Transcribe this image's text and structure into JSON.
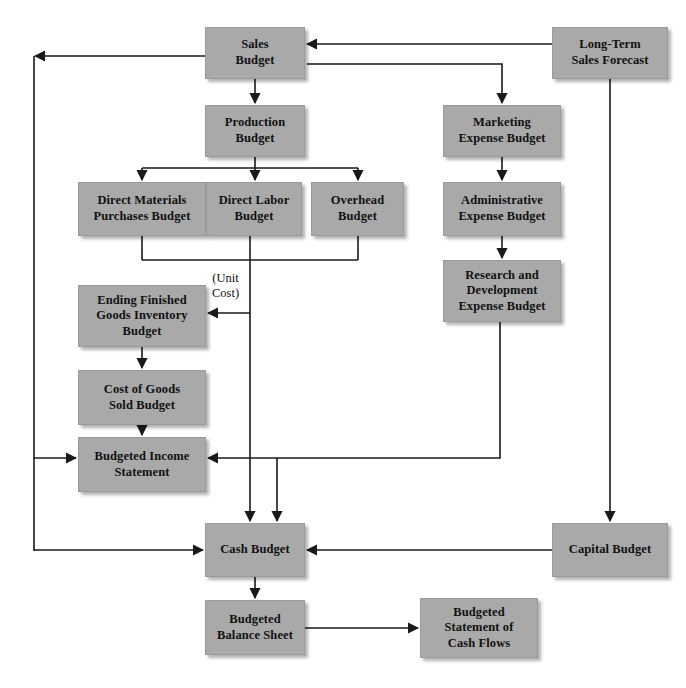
{
  "diagram": {
    "style": {
      "box_fill": "#a9a9a9",
      "box_border": "#9a9a9a",
      "line_color": "#1a1a1a",
      "text_color": "#111111",
      "background": "#ffffff"
    },
    "nodes": [
      {
        "id": "sales_budget",
        "label": "Sales\nBudget",
        "x": 205,
        "y": 27,
        "w": 100,
        "h": 52
      },
      {
        "id": "long_term_sales_forecast",
        "label": "Long-Term\nSales Forecast",
        "x": 552,
        "y": 27,
        "w": 116,
        "h": 52
      },
      {
        "id": "production_budget",
        "label": "Production\nBudget",
        "x": 205,
        "y": 105,
        "w": 100,
        "h": 52
      },
      {
        "id": "marketing_expense_budget",
        "label": "Marketing\nExpense Budget",
        "x": 443,
        "y": 105,
        "w": 118,
        "h": 52
      },
      {
        "id": "direct_materials_budget",
        "label": "Direct Materials\nPurchases Budget",
        "x": 78,
        "y": 182,
        "w": 128,
        "h": 54
      },
      {
        "id": "direct_labor_budget",
        "label": "Direct Labor\nBudget",
        "x": 206,
        "y": 182,
        "w": 96,
        "h": 54
      },
      {
        "id": "overhead_budget",
        "label": "Overhead\nBudget",
        "x": 311,
        "y": 182,
        "w": 93,
        "h": 54
      },
      {
        "id": "admin_expense_budget",
        "label": "Administrative\nExpense Budget",
        "x": 443,
        "y": 182,
        "w": 118,
        "h": 54
      },
      {
        "id": "ending_fg_inventory",
        "label": "Ending Finished\nGoods Inventory\nBudget",
        "x": 78,
        "y": 285,
        "w": 128,
        "h": 62
      },
      {
        "id": "rd_expense_budget",
        "label": "Research and\nDevelopment\nExpense Budget",
        "x": 443,
        "y": 260,
        "w": 118,
        "h": 62
      },
      {
        "id": "cogs_budget",
        "label": "Cost of Goods\nSold Budget",
        "x": 78,
        "y": 370,
        "w": 128,
        "h": 55
      },
      {
        "id": "budgeted_income_stmt",
        "label": "Budgeted Income\nStatement",
        "x": 78,
        "y": 437,
        "w": 128,
        "h": 55
      },
      {
        "id": "cash_budget",
        "label": "Cash Budget",
        "x": 205,
        "y": 523,
        "w": 100,
        "h": 54
      },
      {
        "id": "capital_budget",
        "label": "Capital Budget",
        "x": 552,
        "y": 523,
        "w": 116,
        "h": 54
      },
      {
        "id": "budgeted_balance_sheet",
        "label": "Budgeted\nBalance Sheet",
        "x": 205,
        "y": 600,
        "w": 100,
        "h": 55
      },
      {
        "id": "budgeted_stmt_cash_flows",
        "label": "Budgeted\nStatement of\nCash Flows",
        "x": 420,
        "y": 598,
        "w": 118,
        "h": 60
      }
    ],
    "edge_labels": [
      {
        "id": "unit_cost",
        "text": "(Unit\nCost)",
        "x": 212,
        "y": 271
      }
    ],
    "edges": [
      {
        "from": "long_term_sales_forecast",
        "to": "sales_budget"
      },
      {
        "from": "sales_budget",
        "to": "production_budget"
      },
      {
        "from": "sales_budget",
        "to": "marketing_expense_budget"
      },
      {
        "from": "sales_budget",
        "to": "left_return_line"
      },
      {
        "from": "production_budget",
        "to": "direct_materials_budget"
      },
      {
        "from": "production_budget",
        "to": "direct_labor_budget"
      },
      {
        "from": "production_budget",
        "to": "overhead_budget"
      },
      {
        "from": "direct_materials_budget",
        "to": "cash_budget"
      },
      {
        "from": "direct_labor_budget",
        "to": "cash_budget"
      },
      {
        "from": "overhead_budget",
        "to": "cash_budget"
      },
      {
        "from": "direct_costs_junction",
        "to": "ending_fg_inventory",
        "label": "(Unit Cost)"
      },
      {
        "from": "ending_fg_inventory",
        "to": "cogs_budget"
      },
      {
        "from": "cogs_budget",
        "to": "budgeted_income_stmt"
      },
      {
        "from": "marketing_expense_budget",
        "to": "admin_expense_budget"
      },
      {
        "from": "admin_expense_budget",
        "to": "rd_expense_budget"
      },
      {
        "from": "rd_expense_budget",
        "to": "budgeted_income_stmt"
      },
      {
        "from": "rd_expense_budget",
        "to": "cash_budget"
      },
      {
        "from": "left_return_line",
        "to": "budgeted_income_stmt"
      },
      {
        "from": "left_return_line",
        "to": "cash_budget"
      },
      {
        "from": "long_term_sales_forecast",
        "to": "capital_budget"
      },
      {
        "from": "capital_budget",
        "to": "cash_budget"
      },
      {
        "from": "cash_budget",
        "to": "budgeted_balance_sheet"
      },
      {
        "from": "budgeted_balance_sheet",
        "to": "budgeted_stmt_cash_flows"
      }
    ]
  }
}
